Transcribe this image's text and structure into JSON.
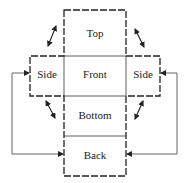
{
  "diagram": {
    "type": "cube-net",
    "faces": {
      "top": "Top",
      "side_left": "Side",
      "front": "Front",
      "side_right": "Side",
      "bottom": "Bottom",
      "back": "Back"
    },
    "colors": {
      "stroke": "#222222",
      "connector": "#555555",
      "background": "#ffffff"
    },
    "connections": [
      {
        "from": "Side (left)",
        "to": "Back",
        "style": "elbow-arrow"
      },
      {
        "from": "Side (right)",
        "to": "Back",
        "style": "elbow-arrow"
      }
    ],
    "fold_arrows": [
      "Top-left double-headed",
      "Top-right double-headed",
      "Bottom-left double-headed",
      "Bottom-right double-headed"
    ]
  }
}
